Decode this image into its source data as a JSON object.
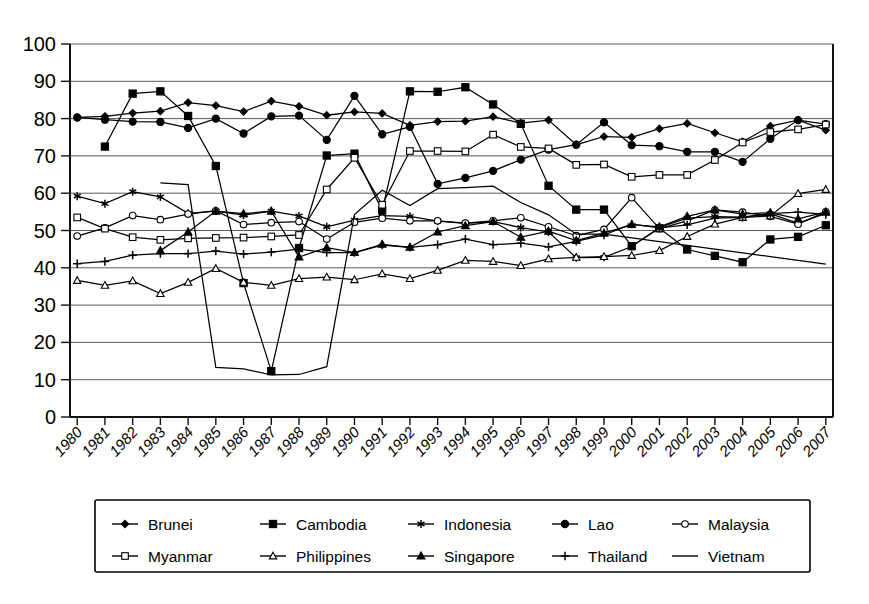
{
  "chart_data": {
    "type": "line",
    "title": "",
    "subtitle": "",
    "xlabel": "",
    "ylabel": "",
    "xlim": [
      1980,
      2007
    ],
    "ylim": [
      0,
      100
    ],
    "grid": true,
    "legend_position": "bottom",
    "y_ticks": [
      0,
      10,
      20,
      30,
      40,
      50,
      60,
      70,
      80,
      90,
      100
    ],
    "y_tick_labels": [
      "0",
      "10",
      "20",
      "30",
      "40",
      "50",
      "60",
      "70",
      "80",
      "90",
      "100"
    ],
    "x": [
      1980,
      1981,
      1982,
      1983,
      1984,
      1985,
      1986,
      1987,
      1988,
      1989,
      1990,
      1991,
      1992,
      1993,
      1994,
      1995,
      1996,
      1997,
      1998,
      1999,
      2000,
      2001,
      2002,
      2003,
      2004,
      2005,
      2006,
      2007
    ],
    "categories": [
      "1980",
      "1981",
      "1982",
      "1983",
      "1984",
      "1985",
      "1986",
      "1987",
      "1988",
      "1989",
      "1990",
      "1991",
      "1992",
      "1993",
      "1994",
      "1995",
      "1996",
      "1997",
      "1998",
      "1999",
      "2000",
      "2001",
      "2002",
      "2003",
      "2004",
      "2005",
      "2006",
      "2007"
    ],
    "series": [
      {
        "name": "Brunei",
        "marker": "filled-diamond",
        "values": [
          80.3,
          80.6,
          81.5,
          82.0,
          84.3,
          83.5,
          81.9,
          84.7,
          83.3,
          80.9,
          81.8,
          81.4,
          78.2,
          79.2,
          79.3,
          80.5,
          78.8,
          79.6,
          73.0,
          75.2,
          75.0,
          77.3,
          78.7,
          76.2,
          73.8,
          78.0,
          79.6,
          76.9
        ]
      },
      {
        "name": "Cambodia",
        "marker": "filled-square",
        "values": [
          null,
          72.5,
          86.7,
          87.3,
          80.7,
          67.3,
          35.9,
          12.3,
          45.3,
          70.1,
          70.6,
          55.4,
          87.3,
          87.2,
          88.4,
          83.8,
          78.6,
          62.0,
          55.6,
          55.6,
          45.8,
          50.6,
          44.9,
          43.2,
          41.5,
          47.6,
          48.3,
          51.4
        ]
      },
      {
        "name": "Indonesia",
        "marker": "asterisk",
        "values": [
          59.2,
          57.2,
          60.4,
          59.0,
          54.6,
          55.2,
          54.1,
          55.2,
          53.9,
          51.0,
          52.8,
          54.0,
          53.8,
          52.5,
          51.9,
          52.4,
          50.8,
          49.6,
          42.7,
          42.8,
          45.7,
          50.8,
          53.3,
          53.7,
          53.6,
          54.5,
          51.9,
          54.6
        ]
      },
      {
        "name": "Lao",
        "marker": "filled-circle",
        "values": [
          80.3,
          79.7,
          79.2,
          79.1,
          77.5,
          80.0,
          76.0,
          80.6,
          80.8,
          74.3,
          86.1,
          75.8,
          77.8,
          62.5,
          64.1,
          66.0,
          69.0,
          71.7,
          73.0,
          79.0,
          72.9,
          72.6,
          71.1,
          71.1,
          68.4,
          74.6,
          79.6,
          78.5
        ]
      },
      {
        "name": "Malaysia",
        "marker": "open-circle",
        "values": [
          48.5,
          50.7,
          54.0,
          52.9,
          54.4,
          55.3,
          51.6,
          52.1,
          52.4,
          47.7,
          52.2,
          53.3,
          52.6,
          52.6,
          52.0,
          52.6,
          53.4,
          51.0,
          48.6,
          50.3,
          58.8,
          50.5,
          52.6,
          55.5,
          54.9,
          53.8,
          51.7,
          55.0
        ]
      },
      {
        "name": "Myanmar",
        "marker": "open-square",
        "values": [
          53.5,
          50.5,
          48.2,
          47.5,
          47.9,
          48.0,
          48.1,
          48.4,
          48.8,
          61.0,
          69.5,
          56.9,
          71.3,
          71.3,
          71.2,
          75.7,
          72.4,
          72.0,
          67.6,
          67.7,
          64.4,
          64.9,
          64.9,
          68.9,
          73.6,
          76.4,
          77.1,
          78.4
        ]
      },
      {
        "name": "Philippines",
        "marker": "open-triangle",
        "values": [
          36.6,
          35.3,
          36.5,
          33.1,
          36.1,
          39.8,
          36.1,
          35.3,
          37.1,
          37.5,
          36.8,
          38.4,
          37.1,
          39.3,
          42.0,
          41.7,
          40.6,
          42.4,
          42.8,
          43.0,
          43.3,
          44.6,
          48.4,
          51.7,
          53.5,
          53.9,
          59.9,
          61.0
        ]
      },
      {
        "name": "Singapore",
        "marker": "filled-triangle",
        "values": [
          null,
          null,
          null,
          44.6,
          49.6,
          55.2,
          54.5,
          55.2,
          42.9,
          45.4,
          44.1,
          46.3,
          45.5,
          49.6,
          51.3,
          52.4,
          48.2,
          49.8,
          47.3,
          49.3,
          51.6,
          51.0,
          53.8,
          55.5,
          54.4,
          54.8,
          53.1,
          55.0
        ]
      },
      {
        "name": "Thailand",
        "marker": "plus",
        "values": [
          41.1,
          41.7,
          43.4,
          43.8,
          43.8,
          44.5,
          43.7,
          44.2,
          45.0,
          44.1,
          44.1,
          46.1,
          45.5,
          46.2,
          47.7,
          46.2,
          46.6,
          45.6,
          47.1,
          48.8,
          51.7,
          50.7,
          51.5,
          53.3,
          53.5,
          54.5,
          54.9,
          54.3
        ]
      },
      {
        "name": "Vietnam",
        "marker": "none",
        "values": [
          null,
          null,
          null,
          62.8,
          62.3,
          13.3,
          12.9,
          11.3,
          11.4,
          13.5,
          54.3,
          60.8,
          56.7,
          61.2,
          61.5,
          61.9,
          57.5,
          54.2,
          49.0,
          49.0,
          48.0,
          47.0,
          46.0,
          45.0,
          44.0,
          43.0,
          42.0,
          41.0
        ]
      }
    ]
  },
  "legend": {
    "rows": [
      [
        {
          "label": "Brunei",
          "marker": "filled-diamond"
        },
        {
          "label": "Cambodia",
          "marker": "filled-square"
        },
        {
          "label": "Indonesia",
          "marker": "asterisk"
        },
        {
          "label": "Lao",
          "marker": "filled-circle"
        },
        {
          "label": "Malaysia",
          "marker": "open-circle"
        }
      ],
      [
        {
          "label": "Myanmar",
          "marker": "open-square"
        },
        {
          "label": "Philippines",
          "marker": "open-triangle"
        },
        {
          "label": "Singapore",
          "marker": "filled-triangle"
        },
        {
          "label": "Thailand",
          "marker": "plus"
        },
        {
          "label": "Vietnam",
          "marker": "none"
        }
      ]
    ]
  },
  "colors": {
    "ink": "#000000",
    "grid": "#5a5a5a",
    "background": "#ffffff"
  }
}
